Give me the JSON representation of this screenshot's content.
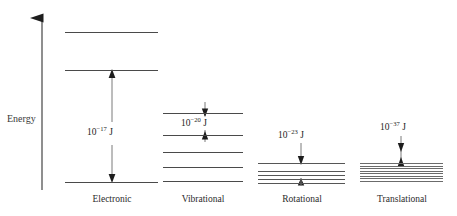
{
  "figure": {
    "energy_axis_label": "Energy",
    "axis_direction": "up",
    "background_color": "#ffffff",
    "line_color": "#4a4a4a",
    "text_color": "#2b2b2b"
  },
  "chart_data": {
    "type": "diagram",
    "title": "",
    "xlabel": "",
    "ylabel": "Energy",
    "grid": false,
    "legend_position": "none",
    "annotations": [
      "10^-17 J",
      "10^-20 J",
      "10^-23 J",
      "10^-37 J"
    ],
    "categories": [
      "Electronic",
      "Vibrational",
      "Rotational",
      "Translational"
    ],
    "series": [
      {
        "name": "Electronic",
        "label": "Electronic",
        "spacing_label_mantissa": "10",
        "spacing_label_exponent": "−17",
        "spacing_label_unit": "J",
        "spacing_value": "1e-17",
        "level_count": 3,
        "level_positions_px": [
          32,
          70,
          182
        ],
        "arrow_from_px": 70,
        "arrow_to_px": 182
      },
      {
        "name": "Vibrational",
        "label": "Vibrational",
        "spacing_label_mantissa": "10",
        "spacing_label_exponent": "−20",
        "spacing_label_unit": "J",
        "spacing_value": "1e-20",
        "level_count": 5,
        "level_positions_px": [
          113,
          135,
          152,
          167,
          181
        ],
        "arrow_from_px": 113,
        "arrow_to_px": 135
      },
      {
        "name": "Rotational",
        "label": "Rotational",
        "spacing_label_mantissa": "10",
        "spacing_label_exponent": "−23",
        "spacing_label_unit": "J",
        "spacing_value": "1e-23",
        "level_count": 5,
        "level_positions_px": [
          163,
          171,
          175,
          179,
          182
        ],
        "arrow_from_px": 163,
        "arrow_to_px": 179
      },
      {
        "name": "Translational",
        "label": "Translational",
        "spacing_label_mantissa": "10",
        "spacing_label_exponent": "−37",
        "spacing_label_unit": "J",
        "spacing_value": "1e-37",
        "level_count": 9,
        "band_top_px": 163,
        "band_bottom_px": 183,
        "arrow_from_px": 148,
        "arrow_to_px": 166
      }
    ]
  }
}
